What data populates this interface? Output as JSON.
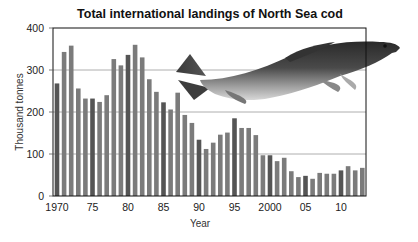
{
  "chart_data": {
    "type": "bar",
    "title": "Total international landings of North Sea cod",
    "xlabel": "Year",
    "ylabel": "Thousand tonnes",
    "ylim": [
      0,
      400
    ],
    "yticks": [
      0,
      100,
      200,
      300,
      400
    ],
    "grid": "horizontal",
    "xtick_labels": [
      {
        "year": 1970,
        "label": "1970"
      },
      {
        "year": 1975,
        "label": "75"
      },
      {
        "year": 1980,
        "label": "80"
      },
      {
        "year": 1985,
        "label": "85"
      },
      {
        "year": 1990,
        "label": "90"
      },
      {
        "year": 1995,
        "label": "95"
      },
      {
        "year": 2000,
        "label": "2000"
      },
      {
        "year": 2005,
        "label": "05"
      },
      {
        "year": 2010,
        "label": "10"
      }
    ],
    "categories": [
      1970,
      1971,
      1972,
      1973,
      1974,
      1975,
      1976,
      1977,
      1978,
      1979,
      1980,
      1981,
      1982,
      1983,
      1984,
      1985,
      1986,
      1987,
      1988,
      1989,
      1990,
      1991,
      1992,
      1993,
      1994,
      1995,
      1996,
      1997,
      1998,
      1999,
      2000,
      2001,
      2002,
      2003,
      2004,
      2005,
      2006,
      2007,
      2008,
      2009,
      2010,
      2011,
      2012,
      2013
    ],
    "values": [
      268,
      343,
      358,
      256,
      232,
      232,
      224,
      240,
      326,
      311,
      336,
      360,
      330,
      278,
      248,
      223,
      206,
      246,
      193,
      174,
      134,
      112,
      127,
      146,
      151,
      185,
      162,
      162,
      145,
      97,
      97,
      83,
      91,
      59,
      45,
      48,
      41,
      55,
      53,
      53,
      61,
      71,
      61,
      67
    ],
    "bar_color": "#7b7b7b",
    "highlight_color": "#555555",
    "highlight_rule": "every fifth year (1970, 1975, ...) drawn darker",
    "annotation": "photo of an Atlantic cod"
  }
}
